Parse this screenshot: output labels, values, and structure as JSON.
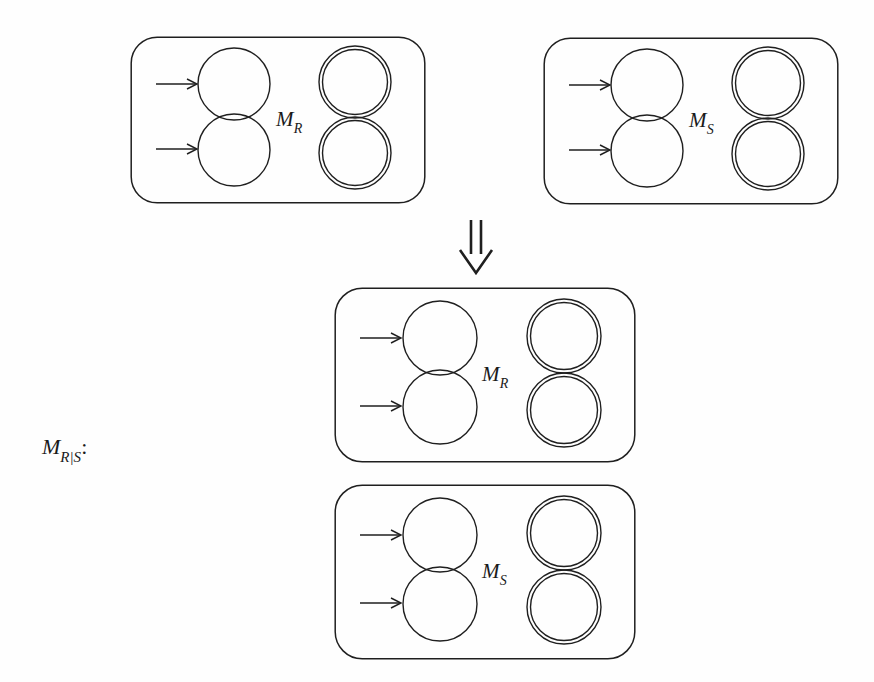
{
  "figure": {
    "type": "diagram",
    "background_color": "#fefefe",
    "stroke_color": "#1f1f1f",
    "description_label": "M_{R|S}:",
    "left_label": {
      "base": "M",
      "subscript": "R|S",
      "colon": ":"
    },
    "implication_symbol": "⇓",
    "boxes": [
      {
        "id": "top-left",
        "label_base": "M",
        "label_subscript": "R",
        "x": 130,
        "y": 36,
        "width": 296,
        "height": 168,
        "corner_radius": 26,
        "input_states": 2,
        "output_states": 2,
        "input_arrows": 2,
        "state_radius": 36,
        "accepting_inner_gap": 4
      },
      {
        "id": "top-right",
        "label_base": "M",
        "label_subscript": "S",
        "x": 543,
        "y": 37,
        "width": 296,
        "height": 168,
        "corner_radius": 26,
        "input_states": 2,
        "output_states": 2,
        "input_arrows": 2,
        "state_radius": 36,
        "accepting_inner_gap": 4
      },
      {
        "id": "bottom-upper",
        "label_base": "M",
        "label_subscript": "R",
        "x": 334,
        "y": 287,
        "width": 302,
        "height": 176,
        "corner_radius": 27,
        "input_states": 2,
        "output_states": 2,
        "input_arrows": 2,
        "state_radius": 37,
        "accepting_inner_gap": 4
      },
      {
        "id": "bottom-lower",
        "label_base": "M",
        "label_subscript": "S",
        "x": 334,
        "y": 484,
        "width": 302,
        "height": 176,
        "corner_radius": 27,
        "input_states": 2,
        "output_states": 2,
        "input_arrows": 2,
        "state_radius": 37,
        "accepting_inner_gap": 4
      }
    ]
  }
}
